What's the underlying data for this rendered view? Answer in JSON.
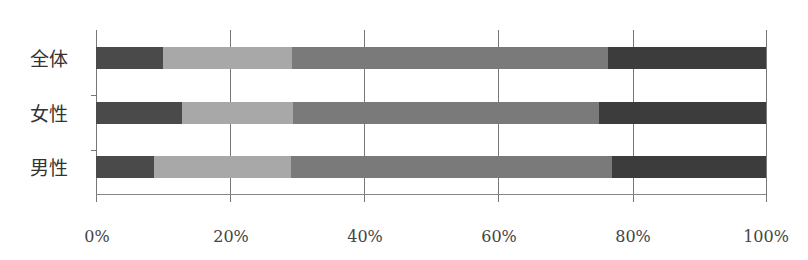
{
  "chart_data": {
    "type": "bar",
    "orientation": "horizontal",
    "stacked": true,
    "normalized_percent": true,
    "title": "",
    "xlabel": "",
    "ylabel": "",
    "categories": [
      "全体",
      "女性",
      "男性"
    ],
    "series": [
      {
        "name": "Segment 1",
        "color": "#4a4a4a",
        "values": [
          10.0,
          12.8,
          8.7
        ]
      },
      {
        "name": "Segment 2",
        "color": "#a8a8a8",
        "values": [
          19.3,
          16.6,
          20.4
        ]
      },
      {
        "name": "Segment 3",
        "color": "#7a7a7a",
        "values": [
          47.1,
          45.7,
          47.9
        ]
      },
      {
        "name": "Segment 4",
        "color": "#3c3c3c",
        "values": [
          23.6,
          24.9,
          23.0
        ]
      }
    ],
    "xlim": [
      0,
      100
    ],
    "x_ticks": [
      "0%",
      "20%",
      "40%",
      "60%",
      "80%",
      "100%"
    ],
    "grid": "vertical",
    "legend": "none"
  },
  "labels": {
    "rows": [
      "全体",
      "女性",
      "男性"
    ],
    "ticks": [
      "0%",
      "20%",
      "40%",
      "60%",
      "80%",
      "100%"
    ]
  }
}
